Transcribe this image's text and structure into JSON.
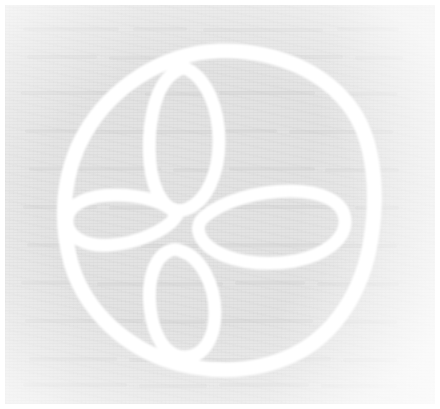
{
  "page": {
    "width": 440,
    "height": 409,
    "background_color": "#ffffff"
  },
  "scan": {
    "paper_color": "#e3e3e3",
    "paper_highlight_color": "#f2f2f2",
    "ink_color": "#ffffff",
    "border_color": "#fafafa",
    "margin_px": 5,
    "texture": "faint paper grain with ghost text bleed-through"
  },
  "artwork": {
    "name": "quatrefoil-in-circle",
    "description": "Hand-drawn circle enclosing a four-petal quatrefoil rosette, drawn in thick white strokes on gray paper",
    "stroke_color": "#ffffff",
    "stroke_width_px": 13,
    "elements": [
      {
        "name": "outer-circle",
        "shape": "circle",
        "center_x": 214,
        "center_y": 203,
        "radius_x": 152,
        "radius_y": 157
      },
      {
        "name": "petal-top",
        "shape": "ellipse",
        "center_x": 180,
        "center_y": 134,
        "radius_x": 36,
        "radius_y": 70,
        "rotation_deg": 2
      },
      {
        "name": "petal-right",
        "shape": "ellipse",
        "center_x": 268,
        "center_y": 222,
        "radius_x": 72,
        "radius_y": 37,
        "rotation_deg": -8
      },
      {
        "name": "petal-bottom",
        "shape": "ellipse",
        "center_x": 177,
        "center_y": 299,
        "radius_x": 35,
        "radius_y": 57,
        "rotation_deg": -3
      },
      {
        "name": "petal-left",
        "shape": "ellipse",
        "center_x": 117,
        "center_y": 215,
        "radius_x": 58,
        "radius_y": 26,
        "rotation_deg": -4
      }
    ]
  }
}
